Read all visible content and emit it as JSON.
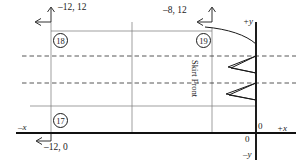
{
  "diagram": {
    "piece_label": "Skirt Front",
    "axes": {
      "plus_x": "+x",
      "minus_x": "–x",
      "plus_y": "+y",
      "minus_y": "–y",
      "origin_upper": "0",
      "origin_lower": "0"
    },
    "coordinates": [
      {
        "id": "pt-18",
        "marker": "18",
        "label": "–12, 12"
      },
      {
        "id": "pt-19",
        "marker": "19",
        "label": "–8, 12"
      },
      {
        "id": "pt-17",
        "marker": "17",
        "label": "–12, 0"
      }
    ],
    "markers": {
      "m17": "17",
      "m18": "18",
      "m19": "19"
    },
    "colors": {
      "ink": "#1a1a1a",
      "axis": "#111111",
      "construction": "#666666",
      "dashed": "#333333",
      "background": "#ffffff"
    }
  }
}
